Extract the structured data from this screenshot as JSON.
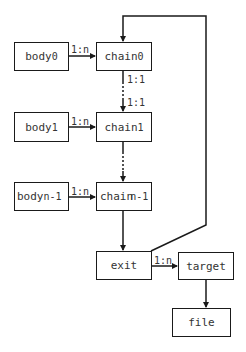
{
  "diagram": {
    "nodes": {
      "body0": {
        "base": "body",
        "sub": "0"
      },
      "chain0": {
        "base": "chain",
        "sub": "0"
      },
      "body1": {
        "base": "body",
        "sub": "1"
      },
      "chain1": {
        "base": "chain",
        "sub": "1"
      },
      "bodyn1": {
        "base": "body",
        "sub": "n-1"
      },
      "chainn1": {
        "base": "chain",
        "sub": "n-1"
      },
      "exit": {
        "base": "exit"
      },
      "target": {
        "base": "target"
      },
      "file": {
        "base": "file"
      }
    },
    "edges": {
      "body0_chain0": "1:n",
      "chain0_out": "1:1",
      "chain1_in": "1:1",
      "body1_chain1": "1:n",
      "bodyn1_chainn1": "1:n",
      "exit_target": "1:n"
    },
    "colors": {
      "line": "#1a1a1a",
      "text": "#333333",
      "background": "#ffffff"
    }
  }
}
